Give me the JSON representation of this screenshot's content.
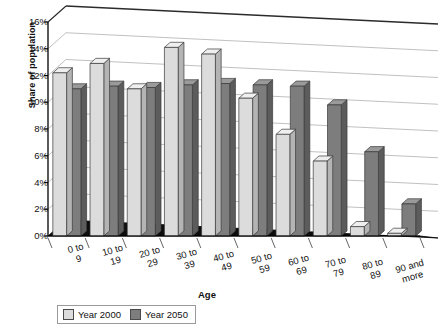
{
  "chart_data": {
    "type": "bar",
    "title": "",
    "xlabel": "Age",
    "ylabel": "Share of population",
    "categories": [
      "0 to 9",
      "10 to 19",
      "20 to 29",
      "30 to 39",
      "40 to 49",
      "50 to 59",
      "60 to 69",
      "70 to 79",
      "80 to 89",
      "90 and more"
    ],
    "series": [
      {
        "name": "Year 2000",
        "color": "#dcdcdc",
        "values": [
          12.2,
          12.9,
          11.0,
          14.1,
          13.6,
          10.3,
          7.6,
          5.6,
          0.7,
          0.2
        ]
      },
      {
        "name": "Year 2050",
        "color": "#7d7d7d",
        "values": [
          11.0,
          11.2,
          11.1,
          11.3,
          11.4,
          11.3,
          11.2,
          9.8,
          6.3,
          2.4
        ]
      }
    ],
    "ylim": [
      0,
      16
    ],
    "yticks": [
      "0%",
      "2%",
      "4%",
      "6%",
      "8%",
      "10%",
      "12%",
      "14%",
      "16%"
    ],
    "ytick_values": [
      0,
      2,
      4,
      6,
      8,
      10,
      12,
      14,
      16
    ],
    "grid": true,
    "legend_position": "bottom-left",
    "style": "3d-clustered-column"
  },
  "legend": {
    "items": [
      {
        "label": "Year 2000",
        "color": "#dcdcdc"
      },
      {
        "label": "Year 2050",
        "color": "#7d7d7d"
      }
    ]
  },
  "colors": {
    "series_2000_face": "#dcdcdc",
    "series_2000_side": "#b4b4b4",
    "series_2000_top": "#efefef",
    "series_2050_face": "#7d7d7d",
    "series_2050_side": "#5c5c5c",
    "series_2050_top": "#9a9a9a",
    "floor": "#0d0d0d",
    "axis": "#000000",
    "grid": "#b9b9b9"
  }
}
